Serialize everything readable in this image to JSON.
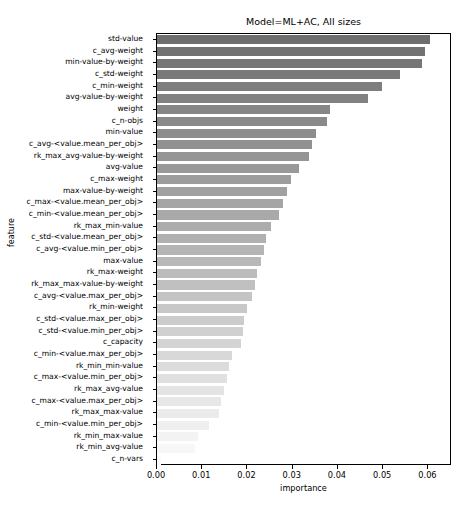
{
  "chart_data": {
    "type": "bar",
    "orientation": "horizontal",
    "title": "Model=ML+AC, All sizes",
    "xlabel": "importance",
    "ylabel": "feature",
    "xlim": [
      0.0,
      0.0652
    ],
    "grid": false,
    "legend": null,
    "xticks": [
      0.0,
      0.01,
      0.02,
      0.03,
      0.04,
      0.05,
      0.06
    ],
    "xticklabels": [
      "0.00",
      "0.01",
      "0.02",
      "0.03",
      "0.04",
      "0.05",
      "0.06"
    ],
    "colormap": "grayscale-dark-to-light",
    "bar_color_max": "#6e6e6e",
    "bar_color_min": "#fbfbfb",
    "categories": [
      "std-value",
      "c_avg-weight",
      "min-value-by-weight",
      "c_std-weight",
      "c_min-weight",
      "avg-value-by-weight",
      "weight",
      "c_n-objs",
      "min-value",
      "c_avg-<value.mean_per_obj>",
      "rk_max_avg-value-by-weight",
      "avg-value",
      "c_max-weight",
      "max-value-by-weight",
      "c_max-<value.mean_per_obj>",
      "c_min-<value.mean_per_obj>",
      "rk_max_min-value",
      "c_std-<value.mean_per_obj>",
      "c_avg-<value.min_per_obj>",
      "max-value",
      "rk_max-weight",
      "rk_max_max-value-by-weight",
      "c_avg-<value.max_per_obj>",
      "rk_min-weight",
      "c_std-<value.max_per_obj>",
      "c_std-<value.min_per_obj>",
      "c_capacity",
      "c_min-<value.max_per_obj>",
      "rk_min_min-value",
      "c_max-<value.min_per_obj>",
      "rk_max_avg-value",
      "c_max-<value.max_per_obj>",
      "rk_max_max-value",
      "c_min-<value.min_per_obj>",
      "rk_min_max-value",
      "rk_min_avg-value",
      "c_n-vars"
    ],
    "values": [
      0.0603,
      0.0592,
      0.0586,
      0.0537,
      0.0497,
      0.0467,
      0.0382,
      0.0375,
      0.0352,
      0.0342,
      0.0337,
      0.0314,
      0.0296,
      0.0288,
      0.0278,
      0.027,
      0.0253,
      0.0242,
      0.0236,
      0.023,
      0.0222,
      0.0216,
      0.0209,
      0.0199,
      0.0193,
      0.019,
      0.0186,
      0.0165,
      0.0159,
      0.0155,
      0.0147,
      0.0142,
      0.0137,
      0.0116,
      0.009,
      0.0083,
      0.0008
    ]
  }
}
